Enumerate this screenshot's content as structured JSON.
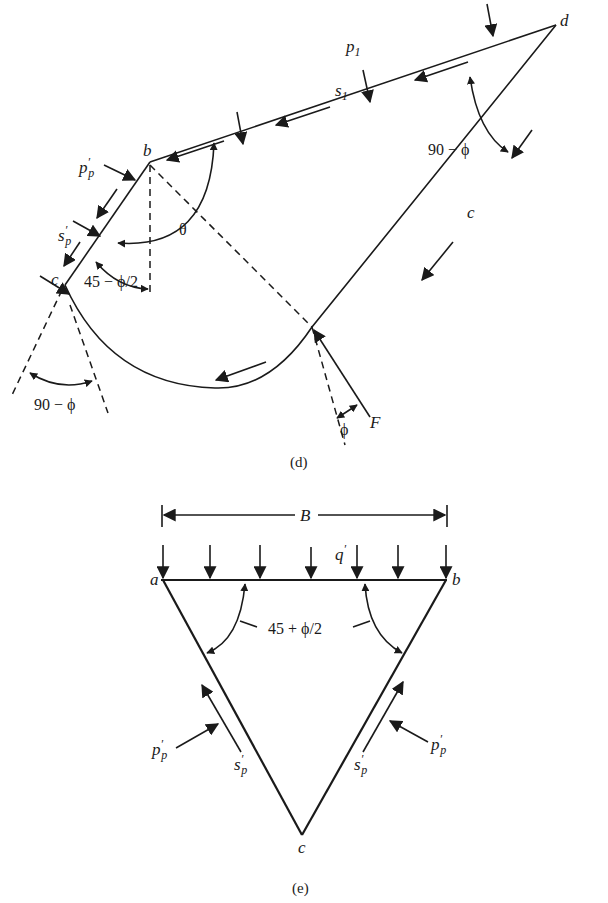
{
  "figure_d": {
    "caption": "(d)",
    "points": {
      "b": "b",
      "d": "d",
      "c_left": "c",
      "c_curve": "c"
    },
    "labels": {
      "p1_main": "p",
      "p1_sub": "1",
      "s1_main": "s",
      "s1_sub": "1",
      "pp_main": "p",
      "pp_prime": "′",
      "pp_sub": "p",
      "sp_main": "s",
      "sp_prime": "′",
      "sp_sub": "p",
      "theta": "θ",
      "angle_45": "45 − ϕ/2",
      "angle_90_right": "90 − ϕ",
      "angle_90_left": "90 − ϕ",
      "phi": "ϕ",
      "F": "F"
    }
  },
  "figure_e": {
    "caption": "(e)",
    "points": {
      "a": "a",
      "b": "b",
      "c": "c"
    },
    "labels": {
      "B": "B",
      "q_main": "q",
      "q_prime": "′",
      "angle": "45 + ϕ/2",
      "pp_left_main": "p",
      "pp_left_prime": "′",
      "pp_left_sub": "p",
      "sp_left_main": "s",
      "sp_left_prime": "′",
      "sp_left_sub": "p",
      "pp_right_main": "p",
      "pp_right_prime": "′",
      "pp_right_sub": "p",
      "sp_right_main": "s",
      "sp_right_prime": "′",
      "sp_right_sub": "p"
    }
  },
  "colors": {
    "ink": "#1a1a1a",
    "background": "#ffffff"
  }
}
